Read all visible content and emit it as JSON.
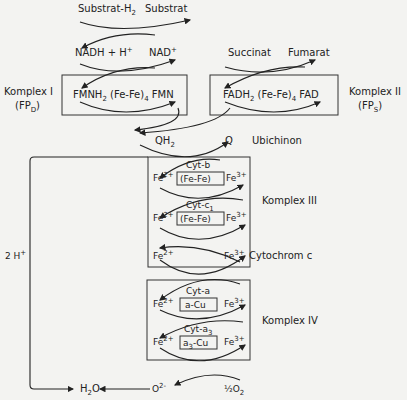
{
  "substrates": {
    "substrate_h2": "Substrat-H",
    "substrate_h2_sub": "2",
    "substrate": "Substrat"
  },
  "nad": {
    "nadh": "NADH + H",
    "nadh_sup": "+",
    "nad": "NAD",
    "nad_sup": "+"
  },
  "complex1": {
    "label": "Komplex I",
    "sub_label": "(FP",
    "sub_label_sub": "D",
    "sub_label_end": ")",
    "fmnh2": "FMNH",
    "fmnh2_sub": "2",
    "fefe": " (Fe-Fe)",
    "fefe_sub": "4",
    "fmn": " FMN"
  },
  "complex2": {
    "label": "Komplex II",
    "sub_label": "(FP",
    "sub_label_sub": "S",
    "sub_label_end": ")",
    "succinat": "Succinat",
    "fumarat": "Fumarat",
    "fadh2": "FADH",
    "fadh2_sub": "2",
    "fefe": " (Fe-Fe)",
    "fefe_sub": "4",
    "fad": " FAD"
  },
  "ubichinon": {
    "qh2": "QH",
    "qh2_sub": "2",
    "q": "Q",
    "label": "Ubichinon"
  },
  "complex3": {
    "label": "Komplex III",
    "cyt_b": "Cyt-b",
    "cyt_c1": "Cyt-c",
    "cyt_c1_sub": "1",
    "fefe": "(Fe-Fe)"
  },
  "iron": {
    "fe2": "Fe",
    "fe2_sup": "2+",
    "fe3": "Fe",
    "fe3_sup": "3+"
  },
  "cytochrom_c": {
    "label": "Cytochrom c"
  },
  "complex4": {
    "label": "Komplex IV",
    "cyt_a": "Cyt-a",
    "a_cu": "a-Cu",
    "cyt_a3": "Cyt-a",
    "cyt_a3_sub": "3",
    "a3_cu": "a",
    "a3_cu_sub": "3",
    "a3_cu_end": "-Cu"
  },
  "bottom": {
    "protons": "2 H",
    "protons_sup": "+",
    "water": "H",
    "water_sub": "2",
    "water_end": "O",
    "oxide": "O",
    "oxide_sup": "2-",
    "oxygen": "½O",
    "oxygen_sub": "2"
  }
}
